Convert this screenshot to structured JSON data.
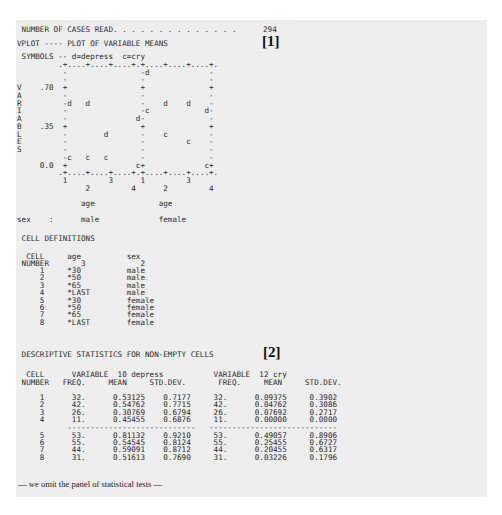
{
  "header": {
    "cases_read_label": " NUMBER OF CASES READ. . . . . . . . . . . . . .",
    "cases_read_value": "294",
    "vplot_title": "VPLOT ---- PLOT OF VARIABLE MEANS",
    "marker_1": "[1]"
  },
  "plot": {
    "lines": [
      " SYMBOLS -- d=depress  c=cry",
      "         .+....+....+....+.+....+....+....+.",
      "          -                -d             -",
      "          -                -              -",
      "V    .70  +                +              +",
      "A         -                -              -",
      "R         -d   d           -    d    d    -",
      "I         -                -c            d-",
      "A         -               d-              -",
      "B    .35  +                +              +",
      "L         -        d       -    c         -",
      "E         -                -         c    -",
      "S         -                -              -",
      "          -c   c   c       -              -",
      "     0.0  +               c+             c+",
      "         .+....+....+....+.+....+....+....+.",
      "          1         3      1         3",
      "               2         4      2         4",
      "",
      "              age              age",
      "",
      "sex    :      male             female"
    ]
  },
  "chart_data": {
    "type": "scatter",
    "title": "VPLOT ---- PLOT OF VARIABLE MEANS",
    "legend": [
      {
        "symbol": "d",
        "name": "depress"
      },
      {
        "symbol": "c",
        "name": "cry"
      }
    ],
    "ylabel": "VARIABLES",
    "yticks": [
      ".70",
      ".35",
      "0.0"
    ],
    "ylim": [
      0.0,
      0.84
    ],
    "xlabel": "age",
    "panels": [
      "male",
      "female"
    ],
    "panel_factor": "sex",
    "categories": [
      "1",
      "2",
      "3",
      "4"
    ],
    "series": [
      {
        "name": "depress",
        "symbol": "d",
        "male": [
          0.53125,
          0.54762,
          0.30769,
          0.45455
        ],
        "female": [
          0.81132,
          0.54545,
          0.59091,
          0.51613
        ]
      },
      {
        "name": "cry",
        "symbol": "c",
        "male": [
          0.09375,
          0.04762,
          0.07692,
          0.0
        ],
        "female": [
          0.49057,
          0.25455,
          0.20455,
          0.03226
        ]
      }
    ],
    "grid": false
  },
  "cell_definitions": {
    "title": " CELL DEFINITIONS",
    "header_1": "  CELL     age          sex",
    "header_2": " NUMBER       3            2",
    "rows": [
      {
        "cell": "1",
        "age": "*30",
        "sex": "male"
      },
      {
        "cell": "2",
        "age": "*50",
        "sex": "male"
      },
      {
        "cell": "3",
        "age": "*65",
        "sex": "male"
      },
      {
        "cell": "4",
        "age": "*LAST",
        "sex": "male"
      },
      {
        "cell": "5",
        "age": "*30",
        "sex": "female"
      },
      {
        "cell": "6",
        "age": "*50",
        "sex": "female"
      },
      {
        "cell": "7",
        "age": "*65",
        "sex": "female"
      },
      {
        "cell": "8",
        "age": "*LAST",
        "sex": "female"
      }
    ]
  },
  "descriptive_stats": {
    "title": " DESCRIPTIVE STATISTICS FOR NON-EMPTY CELLS",
    "marker_2": "[2]",
    "header_1": "  CELL      VARIABLE  10 depress           VARIABLE  12 cry",
    "header_2": " NUMBER   FREQ.     MEAN     STD.DEV.       FREQ.     MEAN     STD.DEV.",
    "variable_1": "10 depress",
    "variable_2": "12 cry",
    "rows": [
      {
        "cell": "1",
        "freq1": "32.",
        "mean1": "0.53125",
        "sd1": "0.7177",
        "freq2": "32.",
        "mean2": "0.09375",
        "sd2": "0.3902"
      },
      {
        "cell": "2",
        "freq1": "42.",
        "mean1": "0.54762",
        "sd1": "0.7715",
        "freq2": "42.",
        "mean2": "0.04762",
        "sd2": "0.3086"
      },
      {
        "cell": "3",
        "freq1": "26.",
        "mean1": "0.30769",
        "sd1": "0.6794",
        "freq2": "26.",
        "mean2": "0.07692",
        "sd2": "0.2717"
      },
      {
        "cell": "4",
        "freq1": "11.",
        "mean1": "0.45455",
        "sd1": "0.6876",
        "freq2": "11.",
        "mean2": "0.00000",
        "sd2": "0.0000"
      },
      {
        "cell": "5",
        "freq1": "53.",
        "mean1": "0.81132",
        "sd1": "0.9210",
        "freq2": "53.",
        "mean2": "0.49057",
        "sd2": "0.8906"
      },
      {
        "cell": "6",
        "freq1": "55.",
        "mean1": "0.54545",
        "sd1": "0.8124",
        "freq2": "55.",
        "mean2": "0.25455",
        "sd2": "0.6727"
      },
      {
        "cell": "7",
        "freq1": "44.",
        "mean1": "0.59091",
        "sd1": "0.8712",
        "freq2": "44.",
        "mean2": "0.20455",
        "sd2": "0.6317"
      },
      {
        "cell": "8",
        "freq1": "31.",
        "mean1": "0.51613",
        "sd1": "0.7690",
        "freq2": "31.",
        "mean2": "0.03226",
        "sd2": "0.1796"
      }
    ],
    "separator": "           ----------------------------   ----------------------------"
  },
  "footer_note": "— we omit the panel of statistical tests —"
}
